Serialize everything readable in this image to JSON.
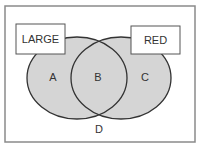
{
  "diagram": {
    "type": "venn",
    "colors": {
      "background": "#ffffff",
      "frame": "#8a8a8a",
      "set_fill": "#d5d5d5",
      "set_stroke": "#333333",
      "label_box_fill": "#ffffff",
      "label_box_stroke": "#555555",
      "text": "#333333"
    },
    "sets": [
      {
        "name": "LARGE",
        "label_box": "LARGE"
      },
      {
        "name": "RED",
        "label_box": "RED"
      }
    ],
    "regions": {
      "a": "A",
      "b": "B",
      "c": "C",
      "d": "D"
    }
  }
}
